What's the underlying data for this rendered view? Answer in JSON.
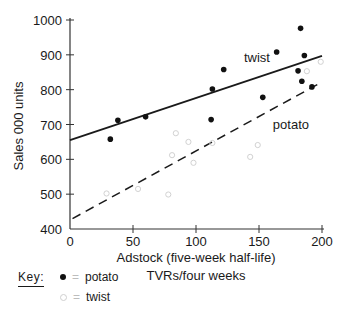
{
  "chart_data": {
    "type": "scatter",
    "title": "",
    "xlabel": "Adstock (five-week half-life)",
    "xlabel_line2": "TVRs/four weeks",
    "ylabel": "Sales 000 units",
    "xlim": [
      0,
      200
    ],
    "ylim": [
      400,
      1000
    ],
    "x_ticks": [
      0,
      50,
      100,
      150,
      200
    ],
    "y_ticks": [
      400,
      500,
      600,
      700,
      800,
      900,
      1000
    ],
    "grid": false,
    "legend_position": "bottom-left",
    "series": [
      {
        "name": "potato",
        "marker": "filled-circle",
        "points": [
          {
            "x": 32,
            "y": 658
          },
          {
            "x": 38,
            "y": 712
          },
          {
            "x": 60,
            "y": 722
          },
          {
            "x": 112,
            "y": 714
          },
          {
            "x": 113,
            "y": 802
          },
          {
            "x": 122,
            "y": 858
          },
          {
            "x": 153,
            "y": 778
          },
          {
            "x": 164,
            "y": 908
          },
          {
            "x": 181,
            "y": 854
          },
          {
            "x": 183,
            "y": 976
          },
          {
            "x": 184,
            "y": 824
          },
          {
            "x": 186,
            "y": 898
          },
          {
            "x": 192,
            "y": 808
          }
        ]
      },
      {
        "name": "twist",
        "marker": "hollow-circle",
        "points": [
          {
            "x": 29,
            "y": 502
          },
          {
            "x": 54,
            "y": 515
          },
          {
            "x": 78,
            "y": 499
          },
          {
            "x": 81,
            "y": 612
          },
          {
            "x": 84,
            "y": 675
          },
          {
            "x": 94,
            "y": 650
          },
          {
            "x": 98,
            "y": 590
          },
          {
            "x": 113,
            "y": 647
          },
          {
            "x": 143,
            "y": 607
          },
          {
            "x": 149,
            "y": 641
          },
          {
            "x": 188,
            "y": 853
          },
          {
            "x": 199,
            "y": 880
          }
        ]
      }
    ],
    "fit_lines": [
      {
        "label": "twist",
        "style": "solid",
        "x": [
          0,
          200
        ],
        "y": [
          655,
          897
        ]
      },
      {
        "label": "potato",
        "style": "dashed",
        "x": [
          2,
          200
        ],
        "y": [
          430,
          822
        ]
      }
    ],
    "annotations": [
      {
        "text": "twist",
        "x": 138,
        "y": 880
      },
      {
        "text": "potato",
        "x": 161,
        "y": 686
      }
    ]
  },
  "legend": {
    "key_label": "Key:",
    "items": [
      {
        "marker": "filled-circle",
        "equals": "=",
        "label": "potato"
      },
      {
        "marker": "hollow-circle",
        "equals": "=",
        "label": "twist"
      }
    ]
  }
}
